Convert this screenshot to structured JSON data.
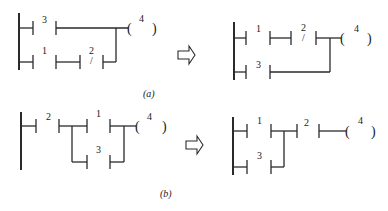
{
  "figure": {
    "panels": [
      {
        "id": "a-before",
        "contacts": [
          {
            "label": "3",
            "type": "normally-open",
            "row": 1
          },
          {
            "label": "1",
            "type": "normally-open",
            "row": 2
          },
          {
            "label": "2",
            "type": "normally-closed",
            "row": 2,
            "mark": "/"
          }
        ],
        "coil": {
          "label": "4",
          "open": "(",
          "close": ")"
        }
      },
      {
        "id": "a-after",
        "contacts": [
          {
            "label": "1",
            "type": "normally-open",
            "row": 1
          },
          {
            "label": "2",
            "type": "normally-closed",
            "row": 1,
            "mark": "/"
          },
          {
            "label": "3",
            "type": "normally-open",
            "row": 2
          }
        ],
        "coil": {
          "label": "4",
          "open": "(",
          "close": ")"
        }
      },
      {
        "id": "b-before",
        "contacts": [
          {
            "label": "2",
            "type": "normally-open",
            "row": 1
          },
          {
            "label": "1",
            "type": "normally-open",
            "row": 1
          },
          {
            "label": "3",
            "type": "normally-open",
            "row": 2
          }
        ],
        "coil": {
          "label": "4",
          "open": "(",
          "close": ")"
        }
      },
      {
        "id": "b-after",
        "contacts": [
          {
            "label": "1",
            "type": "normally-open",
            "row": 1
          },
          {
            "label": "3",
            "type": "normally-open",
            "row": 2
          },
          {
            "label": "2",
            "type": "normally-open",
            "row": 1
          }
        ],
        "coil": {
          "label": "4",
          "open": "(",
          "close": ")"
        }
      }
    ],
    "captions": {
      "a": "(a)",
      "b": "(b)"
    },
    "arrow_icon": "hollow-right-arrow"
  }
}
